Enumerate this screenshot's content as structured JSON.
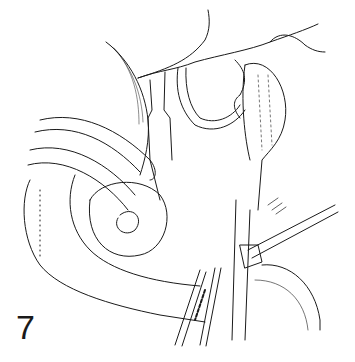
{
  "figure": {
    "number": "7",
    "kind": "surgical line illustration",
    "colors": {
      "ink": "#1a1a1a",
      "background": "#ffffff"
    }
  }
}
